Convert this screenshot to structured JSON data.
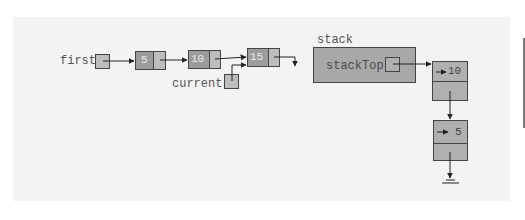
{
  "diagram": {
    "type": "linked-list-and-linked-stack",
    "colors": {
      "panel_bg": "#f3f3f3",
      "node_info_fill": "#9c9c9c",
      "node_link_fill": "#bdbdbd",
      "stack_fill": "#a8a8a8",
      "border": "#444444",
      "label_text": "#555555"
    },
    "linked_list": {
      "head_label": "first",
      "current_label": "current",
      "nodes": [
        {
          "info": "5"
        },
        {
          "info": "10"
        },
        {
          "info": "15"
        }
      ],
      "current_points_to": "15",
      "tail_link": "null"
    },
    "stack": {
      "label": "stack",
      "member_label": "stackTop",
      "nodes": [
        {
          "info": "10"
        },
        {
          "info": "5"
        }
      ],
      "tail_link": "null"
    }
  }
}
